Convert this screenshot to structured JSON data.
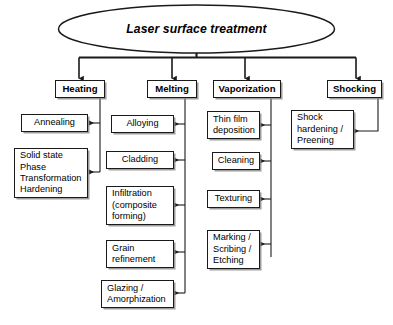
{
  "diagram": {
    "title": "Laser surface treatment",
    "root": {
      "label": "Laser surface treatment",
      "shape": "ellipse"
    },
    "categories": [
      {
        "label": "Heating",
        "children": [
          {
            "label": "Annealing"
          },
          {
            "label": "Solid state\nPhase\nTransformation\nHardening"
          }
        ]
      },
      {
        "label": "Melting",
        "children": [
          {
            "label": "Alloying"
          },
          {
            "label": "Cladding"
          },
          {
            "label": "Infiltration\n(composite\nforming)"
          },
          {
            "label": "Grain\nrefinement"
          },
          {
            "label": "Glazing /\nAmorphization"
          }
        ]
      },
      {
        "label": "Vaporization",
        "children": [
          {
            "label": "Thin film\ndeposition"
          },
          {
            "label": "Cleaning"
          },
          {
            "label": "Texturing"
          },
          {
            "label": "Marking /\nScribing /\nEtching"
          }
        ]
      },
      {
        "label": "Shocking",
        "children": [
          {
            "label": "Shock\nhardening /\nPreening"
          }
        ]
      }
    ],
    "colors": {
      "background": "#ffffff",
      "line": "#1a1a1a",
      "box_border": "#1a1a1a",
      "box_fill": "#ffffff",
      "text": "#000000",
      "shadow": "#8c8c8c"
    }
  }
}
